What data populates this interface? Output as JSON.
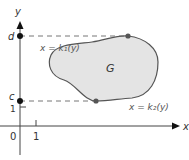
{
  "diagram": {
    "axes": {
      "x_label": "x",
      "y_label": "y",
      "origin_label": "0",
      "x_tick_label": "1",
      "y_tick_label": "1"
    },
    "points": {
      "d_label": "d",
      "c_label": "c"
    },
    "region": {
      "label": "G",
      "fill": "#e4e4e4",
      "stroke": "#555555"
    },
    "curves": {
      "left_boundary": "x = k₁(y)",
      "right_boundary": "x = k₂(y)"
    },
    "colors": {
      "axis": "#444444",
      "dash": "#666666",
      "point": "#111111",
      "boundary_point": "#555555"
    }
  }
}
